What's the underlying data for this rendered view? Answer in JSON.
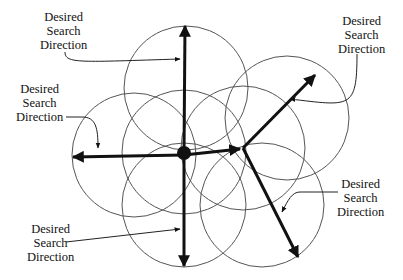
{
  "diagram": {
    "labels": [
      {
        "id": "top",
        "lines": [
          "Desired",
          "Search",
          "Direction"
        ]
      },
      {
        "id": "top-right",
        "lines": [
          "Desired",
          "Search",
          "Direction"
        ]
      },
      {
        "id": "left",
        "lines": [
          "Desired",
          "Search",
          "Direction"
        ]
      },
      {
        "id": "bottom-right",
        "lines": [
          "Desired",
          "Search",
          "Direction"
        ]
      },
      {
        "id": "bottom-left",
        "lines": [
          "Desired",
          "Search",
          "Direction"
        ]
      }
    ],
    "circles": [
      {
        "cx": 186,
        "cy": 88,
        "r": 62
      },
      {
        "cx": 134,
        "cy": 155,
        "r": 62
      },
      {
        "cx": 184,
        "cy": 205,
        "r": 62
      },
      {
        "cx": 184,
        "cy": 152,
        "r": 62
      },
      {
        "cx": 243,
        "cy": 148,
        "r": 62
      },
      {
        "cx": 287,
        "cy": 118,
        "r": 62
      },
      {
        "cx": 262,
        "cy": 205,
        "r": 62
      }
    ],
    "center_point": {
      "x": 184,
      "y": 152
    },
    "vertex_point": {
      "x": 243,
      "y": 148
    },
    "colors": {
      "stroke": "#111111",
      "circle": "#555555"
    }
  }
}
